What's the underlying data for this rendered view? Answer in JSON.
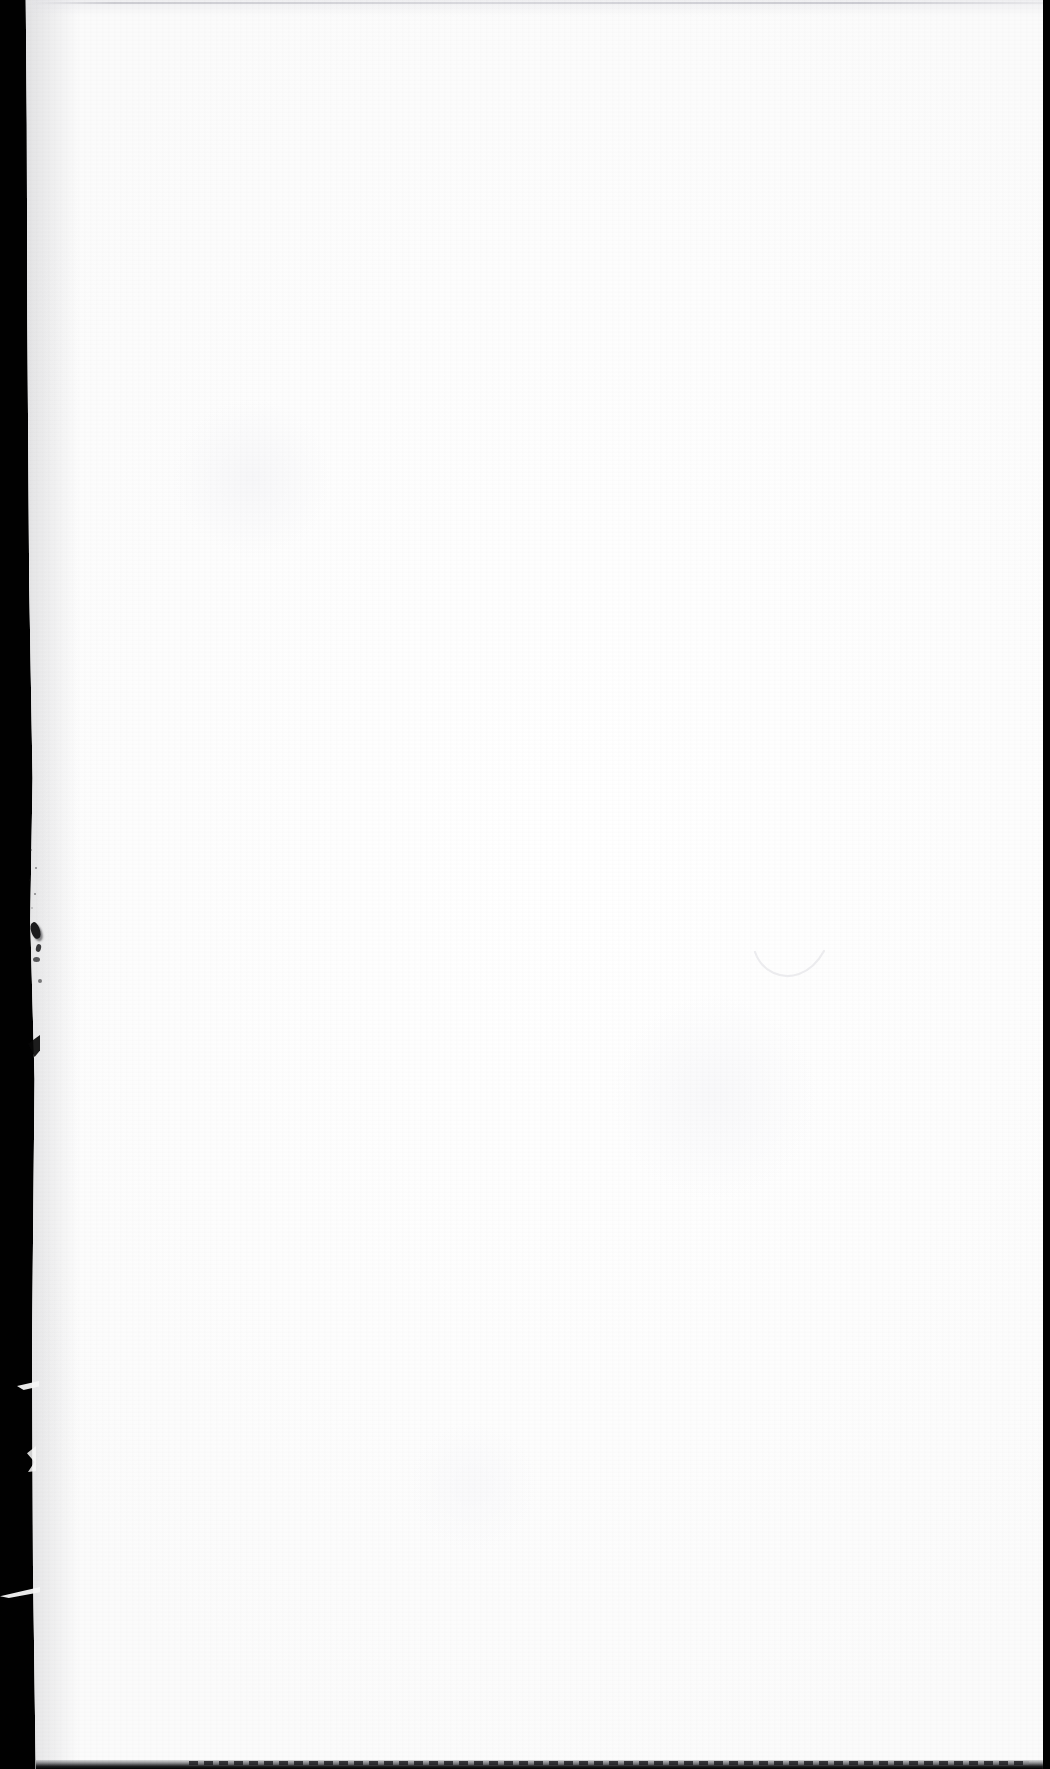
{
  "document": {
    "kind": "scanned-page",
    "content_state": "blank",
    "visible_text": "",
    "page_background_color": "#fdfdfd",
    "scanner_background_color": "#010101"
  },
  "canvas": {
    "width_px": 1050,
    "height_px": 1769
  },
  "artifacts": {
    "top_scan_line": {
      "name": "top-scan-line",
      "description": "faint gray horizontal scan line across the top of the sheet",
      "color": "#c6c6cc"
    },
    "bottom_scan_edge": {
      "name": "bottom-scan-edge",
      "description": "dark dashed line along the bottom edge of the sheet",
      "color": "#1e1e22"
    },
    "right_edge_line": {
      "name": "right-edge-line",
      "description": "thin dark vertical line at the right margin of the sheet",
      "color": "#28282c"
    },
    "left_black_band": {
      "name": "left-black-band",
      "description": "black scanner platen visible along the slanted left edge of the sheet",
      "color": "#010101"
    },
    "ink_smudge": {
      "name": "ink-smudge",
      "description": "small dark ink smudge cluster near the left edge",
      "color": "#1a1a1c"
    },
    "torn_edge": {
      "name": "torn-paper-edge",
      "description": "ragged torn slivers of paper protruding along the left edge",
      "color": "#f6f6f6"
    },
    "faint_curve": {
      "name": "faint-pencil-curve",
      "description": "very faint hook-shaped pencil stroke in the right-center of the page",
      "color": "#efefef"
    }
  }
}
